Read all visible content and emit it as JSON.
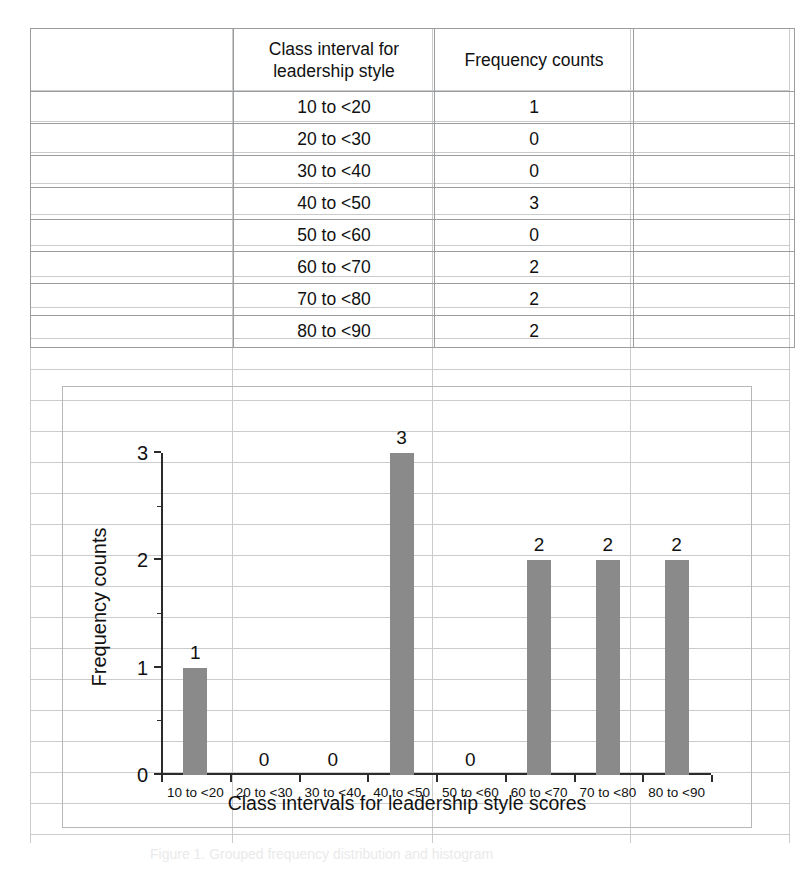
{
  "table": {
    "headers": [
      "",
      "Class interval for leadership style",
      "Frequency counts",
      ""
    ],
    "header_interval": "Class interval for\nleadership style",
    "header_interval_line1": "Class interval for",
    "header_interval_line2": "leadership style",
    "header_frequency": "Frequency counts",
    "rows": [
      {
        "interval": "10 to <20",
        "frequency": "1"
      },
      {
        "interval": "20 to <30",
        "frequency": "0"
      },
      {
        "interval": "30 to <40",
        "frequency": "0"
      },
      {
        "interval": "40 to <50",
        "frequency": "3"
      },
      {
        "interval": "50 to <60",
        "frequency": "0"
      },
      {
        "interval": "60 to <70",
        "frequency": "2"
      },
      {
        "interval": "70 to <80",
        "frequency": "2"
      },
      {
        "interval": "80 to <90",
        "frequency": "2"
      }
    ]
  },
  "chart_data": {
    "type": "bar",
    "title": "",
    "categories": [
      "10 to <20",
      "20 to <30",
      "30 to <40",
      "40 to <50",
      "50 to <60",
      "60 to <70",
      "70 to <80",
      "80 to <90"
    ],
    "values": [
      1,
      0,
      0,
      3,
      0,
      2,
      2,
      2
    ],
    "data_labels": [
      "1",
      "0",
      "0",
      "3",
      "0",
      "2",
      "2",
      "2"
    ],
    "xlabel": "Class intervals for leadership style scores",
    "ylabel": "Frequency counts",
    "ylim": [
      0,
      3
    ],
    "y_ticks": [
      0,
      1,
      2,
      3
    ],
    "y_tick_labels": [
      "0",
      "1",
      "2",
      "3"
    ],
    "y_minor_ticks": [
      0.5,
      1.5,
      2.5
    ],
    "grid": false,
    "legend": false,
    "bar_color": "#8a8a8a",
    "axis_color": "#2b2b2b"
  },
  "caption": {
    "text": "Figure 1. Grouped frequency distribution and histogram"
  },
  "colors": {
    "bar": "#8a8a8a",
    "grid_line": "#c9cbcd",
    "table_border": "#9a9c9e",
    "chart_frame": "#b5b7b9"
  }
}
